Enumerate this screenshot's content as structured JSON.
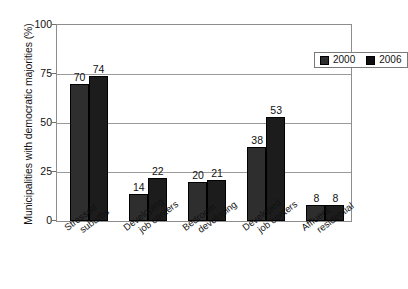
{
  "chart_data": {
    "type": "bar",
    "title": "",
    "xlabel": "",
    "ylabel": "Municipalities with democratic majorities (%)",
    "ylim": [
      0,
      100
    ],
    "yticks": [
      "0",
      "25",
      "50",
      "75",
      "100"
    ],
    "grid": true,
    "legend_position": "top-right",
    "categories": [
      "Stressed suburbs",
      "Developing job centers",
      "Bedroom developing",
      "Developed job centers",
      "Affluent residential"
    ],
    "category_lines": [
      [
        "Stressed",
        "suburbs"
      ],
      [
        "Developing",
        "job centers"
      ],
      [
        "Bedroom",
        "developing"
      ],
      [
        "Developed",
        "job centers"
      ],
      [
        "Affluent",
        "residential"
      ]
    ],
    "series": [
      {
        "name": "2000",
        "color": "#2e2e2e",
        "values": [
          70,
          14,
          20,
          38,
          8
        ]
      },
      {
        "name": "2006",
        "color": "#1c1c1c",
        "values": [
          74,
          22,
          21,
          53,
          8
        ]
      }
    ]
  },
  "legend": {
    "items": [
      {
        "label": "2000",
        "color": "#2e2e2e"
      },
      {
        "label": "2006",
        "color": "#1c1c1c"
      }
    ]
  },
  "axis": {
    "y_title": "Municipalities with democratic majorities (%)",
    "y_ticks": [
      {
        "value": 100,
        "label": "100"
      },
      {
        "value": 75,
        "label": "75"
      },
      {
        "value": 50,
        "label": "50"
      },
      {
        "value": 25,
        "label": "25"
      },
      {
        "value": 0,
        "label": "0"
      }
    ]
  }
}
